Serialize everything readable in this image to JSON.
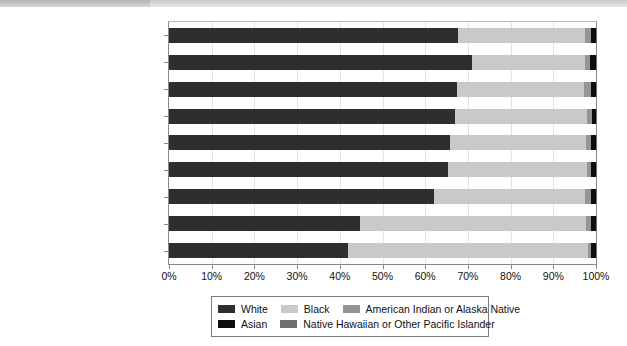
{
  "chart_data": {
    "type": "bar",
    "orientation": "horizontal",
    "stacked": true,
    "stack_total": 100,
    "title": "",
    "subtitle": "",
    "xlabel": "",
    "ylabel": "",
    "xlim": [
      0,
      100
    ],
    "xticks": [
      0,
      10,
      20,
      30,
      40,
      50,
      60,
      70,
      80,
      90,
      100
    ],
    "xtick_labels": [
      "0%",
      "10%",
      "20%",
      "30%",
      "40%",
      "50%",
      "60%",
      "70%",
      "80%",
      "90%",
      "100%"
    ],
    "grid": true,
    "grid_axis": "x",
    "legend_position": "bottom",
    "categories": [
      "Total",
      "Arson",
      "Larceny-theft",
      "Burglary",
      "Rape",
      "Motor vehicle theft",
      "Aggravated assault",
      "Murder and nonnegligent manslaughter",
      "Robbery"
    ],
    "category_display": [
      [
        "Total"
      ],
      [
        "Arson"
      ],
      [
        "Larceny-theft"
      ],
      [
        "Burglary"
      ],
      [
        "Rape"
      ],
      [
        "Motor vehicle theft"
      ],
      [
        "Aggravated assault"
      ],
      [
        "Murder and nonnegligent",
        "manslaughter"
      ],
      [
        "Robbery"
      ]
    ],
    "series": [
      {
        "name": "White",
        "color": "#2e2e2e",
        "values": [
          67.6,
          70.9,
          67.4,
          66.9,
          65.7,
          65.3,
          62.0,
          44.8,
          41.9
        ]
      },
      {
        "name": "Black",
        "color": "#c9c9c9",
        "values": [
          29.9,
          26.5,
          29.9,
          31.0,
          31.9,
          32.6,
          35.5,
          52.9,
          56.2
        ]
      },
      {
        "name": "American Indian or Alaska Native",
        "color": "#959595",
        "values": [
          1.3,
          1.3,
          1.5,
          1.1,
          1.2,
          1.0,
          1.3,
          1.1,
          0.8
        ]
      },
      {
        "name": "Asian",
        "color": "#0d0d0d",
        "values": [
          1.1,
          1.2,
          1.1,
          0.9,
          1.1,
          1.0,
          1.1,
          1.1,
          1.0
        ]
      },
      {
        "name": "Native Hawaiian or Other Pacific Islander",
        "color": "#6f6f6f",
        "values": [
          0.1,
          0.1,
          0.1,
          0.1,
          0.1,
          0.1,
          0.1,
          0.1,
          0.1
        ]
      }
    ]
  },
  "legend": {
    "rows": [
      [
        {
          "label": "White",
          "color": "#2e2e2e"
        },
        {
          "label": "Black",
          "color": "#c9c9c9"
        },
        {
          "label": "American Indian or Alaska Native",
          "color": "#959595"
        }
      ],
      [
        {
          "label": "Asian",
          "color": "#0d0d0d"
        },
        {
          "label": "Native Hawaiian or Other Pacific Islander",
          "color": "#6f6f6f"
        }
      ]
    ]
  }
}
